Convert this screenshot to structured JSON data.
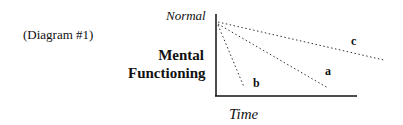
{
  "caption": "(Diagram #1)",
  "axes": {
    "y_top_label": "Normal",
    "y_label_line1": "Mental",
    "y_label_line2": "Functioning",
    "x_label": "Time"
  },
  "lines": [
    {
      "label": "a",
      "style": "dotted",
      "description": "moderate decline"
    },
    {
      "label": "b",
      "style": "dotted",
      "description": "steep decline"
    },
    {
      "label": "c",
      "style": "dotted",
      "description": "gradual decline"
    }
  ],
  "colors": {
    "ink": "#111111",
    "background": "#ffffff"
  }
}
